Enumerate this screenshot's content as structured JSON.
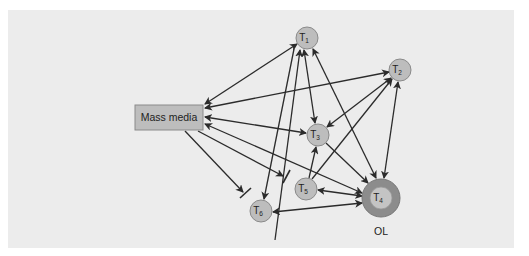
{
  "diagram": {
    "type": "opinion-leader network (two-step flow of communication)",
    "colors": {
      "panel_bg": "#ececec",
      "node_fill": "#bdbdbd",
      "node_stroke": "#8a8a8a",
      "box_fill": "#bdbdbd",
      "ol_ring": "#8c8c8c",
      "edge": "#2b2b2b"
    },
    "source_box": {
      "id": "mass-media",
      "label": "Mass media"
    },
    "nodes": [
      {
        "id": "T1",
        "label": "T",
        "sub": "1"
      },
      {
        "id": "T2",
        "label": "T",
        "sub": "2"
      },
      {
        "id": "T3",
        "label": "T",
        "sub": "3"
      },
      {
        "id": "T4",
        "label": "T",
        "sub": "4",
        "role": "opinion-leader"
      },
      {
        "id": "T5",
        "label": "T",
        "sub": "5"
      },
      {
        "id": "T6",
        "label": "T",
        "sub": "6"
      }
    ],
    "opinion_leader_label": "OL",
    "edges": [
      {
        "from": "Mass media",
        "to": "T1",
        "type": "bidirectional"
      },
      {
        "from": "Mass media",
        "to": "T2",
        "type": "bidirectional"
      },
      {
        "from": "Mass media",
        "to": "T3",
        "type": "bidirectional"
      },
      {
        "from": "Mass media",
        "to": "T4",
        "type": "bidirectional"
      },
      {
        "from": "Mass media",
        "to": "T5",
        "type": "blocked"
      },
      {
        "from": "Mass media",
        "to": "T6",
        "type": "blocked"
      },
      {
        "from": "T1",
        "to": "T3",
        "type": "bidirectional"
      },
      {
        "from": "T1",
        "to": "T4",
        "type": "bidirectional"
      },
      {
        "from": "T6",
        "to": "T1",
        "type": "directed"
      },
      {
        "from": "T1",
        "to": "T6",
        "type": "directed"
      },
      {
        "from": "T2",
        "to": "T3",
        "type": "bidirectional"
      },
      {
        "from": "T2",
        "to": "T4",
        "type": "bidirectional"
      },
      {
        "from": "T5",
        "to": "T2",
        "type": "directed"
      },
      {
        "from": "T3",
        "to": "T4",
        "type": "directed"
      },
      {
        "from": "T5",
        "to": "T3",
        "type": "directed"
      },
      {
        "from": "T4",
        "to": "T5",
        "type": "bidirectional"
      },
      {
        "from": "T4",
        "to": "T6",
        "type": "bidirectional"
      }
    ]
  }
}
